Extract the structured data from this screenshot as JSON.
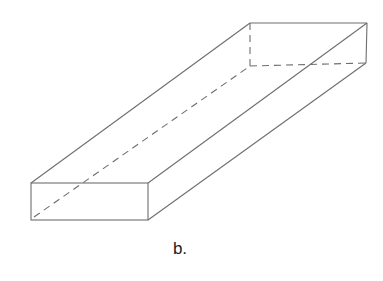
{
  "figure": {
    "type": "rectangular prism (cuboid) line drawing",
    "caption": "b.",
    "line_color": "#6e6e6e",
    "vertices": {
      "front_top_left": [
        31,
        183
      ],
      "front_top_right": [
        148,
        183
      ],
      "front_bottom_left": [
        31,
        220
      ],
      "front_bottom_right": [
        148,
        220
      ],
      "back_top_left": [
        250,
        23
      ],
      "back_top_right": [
        367,
        23
      ],
      "back_bottom_left_hidden": [
        250,
        66
      ],
      "back_bottom_right": [
        366,
        63
      ]
    },
    "visible_edges": [
      "front rectangle",
      "front_top_left to back_top_left",
      "front_top_right to back_top_right",
      "front_bottom_right to back_bottom_right",
      "back_top_left to back_top_right",
      "back_top_right to back_bottom_right"
    ],
    "hidden_edges_dashed": [
      "back_top_left to back_bottom_left_hidden",
      "back_bottom_left_hidden to back_bottom_right",
      "front_bottom_left to back_bottom_left_hidden"
    ]
  }
}
